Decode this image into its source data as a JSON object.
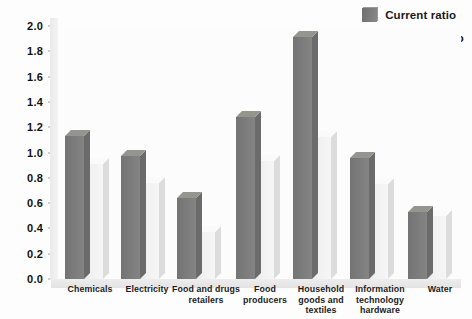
{
  "chart_data": {
    "type": "bar",
    "title": "",
    "subtitle": "",
    "xlabel": "",
    "ylabel": "",
    "ylim": [
      0.0,
      2.0
    ],
    "ytick_labels": [
      "2.0",
      "1.8",
      "1.6",
      "1.4",
      "1.2",
      "1.0",
      "0.8",
      "0.6",
      "0.4",
      "0.2",
      "0.0"
    ],
    "ytick_values": [
      2.0,
      1.8,
      1.6,
      1.4,
      1.2,
      1.0,
      0.8,
      0.6,
      0.4,
      0.2,
      0.0
    ],
    "grid": false,
    "legend_position": "top-right",
    "categories": [
      "Chemicals",
      "Electricity",
      "Food and drugs retailers",
      "Food producers",
      "Household goods and textiles",
      "Information technology hardware",
      "Water"
    ],
    "category_lines": [
      [
        "Chemicals"
      ],
      [
        "Electricity"
      ],
      [
        "Food and drugs",
        "retailers"
      ],
      [
        "Food",
        "producers"
      ],
      [
        "Household",
        "goods and",
        "textiles"
      ],
      [
        "Information",
        "technology",
        "hardware"
      ],
      [
        "Water"
      ]
    ],
    "series": [
      {
        "name": "Current ratio",
        "color": "#7b7b7b",
        "values": [
          1.13,
          0.97,
          0.64,
          1.28,
          1.91,
          0.96,
          0.53
        ]
      },
      {
        "name": "Acid-test ratio",
        "color": "#f2f2f2",
        "values": [
          0.91,
          0.76,
          0.37,
          0.93,
          1.12,
          0.75,
          0.5
        ]
      }
    ]
  },
  "legend": {
    "items": [
      {
        "label": "Current ratio",
        "swatch": "dark"
      },
      {
        "label": "Acid-test ratio",
        "swatch": "light"
      }
    ]
  },
  "colors": {
    "series_current": "#7b7b7b",
    "series_acid": "#f2f2f2",
    "text": "#111111",
    "background": "#ffffff"
  }
}
